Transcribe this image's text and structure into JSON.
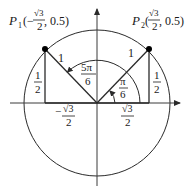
{
  "diagram": {
    "type": "unit-circle",
    "colors": {
      "line": "#2a2a2a",
      "axis": "#3a3a3a",
      "point": "#000000",
      "text": "#1a1a1a"
    },
    "points": [
      {
        "id": "P1",
        "name": "P",
        "subscript": "1",
        "coords_prefix": "(−",
        "x_num": "√3",
        "x_den": "2",
        "coords_suffix": ", 0.5)"
      },
      {
        "id": "P2",
        "name": "P",
        "subscript": "2",
        "coords_prefix": "(",
        "x_num": "√3",
        "x_den": "2",
        "coords_suffix": ", 0.5)"
      }
    ],
    "radius_labels": [
      "1",
      "1"
    ],
    "height_labels": [
      {
        "num": "1",
        "den": "2"
      },
      {
        "num": "1",
        "den": "2"
      }
    ],
    "angles": [
      {
        "num": "5π",
        "den": "6"
      },
      {
        "num": "π",
        "den": "6"
      }
    ],
    "x_labels": [
      {
        "sign": "−",
        "num": "√3",
        "den": "2"
      },
      {
        "sign": "",
        "num": "√3",
        "den": "2"
      }
    ]
  }
}
